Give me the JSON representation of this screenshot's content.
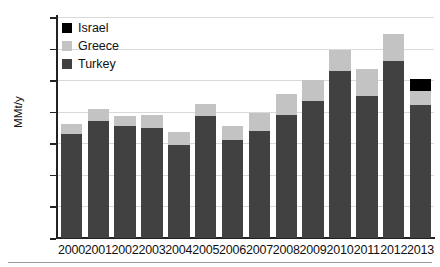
{
  "chart_data": {
    "type": "bar",
    "subtype": "stacked-bar",
    "title": "",
    "xlabel": "",
    "ylabel": "MMt/y",
    "ylim": [
      0,
      7
    ],
    "ytick_values": [
      0,
      1,
      2,
      3,
      4,
      5,
      6,
      7
    ],
    "ytick_labels": [
      "0",
      "1",
      "2",
      "3",
      "4",
      "5",
      "6",
      "7"
    ],
    "grid": "horizontal",
    "legend_position": "top-left",
    "categories": [
      "2000",
      "2001",
      "2002",
      "2003",
      "2004",
      "2005",
      "2006",
      "2007",
      "2008",
      "2009",
      "2010",
      "2011",
      "2012",
      "2013"
    ],
    "series": [
      {
        "name": "Turkey",
        "color": "#414141",
        "values": [
          3.3,
          3.7,
          3.55,
          3.5,
          2.95,
          3.85,
          3.1,
          3.4,
          3.9,
          4.35,
          5.3,
          4.5,
          5.6,
          4.2
        ]
      },
      {
        "name": "Greece",
        "color": "#c3c3c3",
        "values": [
          0.3,
          0.4,
          0.3,
          0.4,
          0.4,
          0.4,
          0.45,
          0.55,
          0.65,
          0.65,
          0.65,
          0.85,
          0.85,
          0.45
        ]
      },
      {
        "name": "Israel",
        "color": "#000000",
        "values": [
          0,
          0,
          0,
          0,
          0,
          0,
          0,
          0,
          0,
          0,
          0,
          0,
          0,
          0.4
        ]
      }
    ],
    "totals": [
      3.6,
      4.1,
      3.85,
      3.9,
      3.35,
      4.25,
      3.55,
      3.95,
      4.55,
      5.0,
      5.95,
      5.35,
      6.45,
      5.05
    ],
    "legend_order": [
      "Israel",
      "Greece",
      "Turkey"
    ]
  },
  "legend": {
    "items": [
      {
        "label": "Israel",
        "color": "#000000"
      },
      {
        "label": "Greece",
        "color": "#c3c3c3"
      },
      {
        "label": "Turkey",
        "color": "#414141"
      }
    ]
  },
  "axes": {
    "y_label": "MMt/y"
  }
}
